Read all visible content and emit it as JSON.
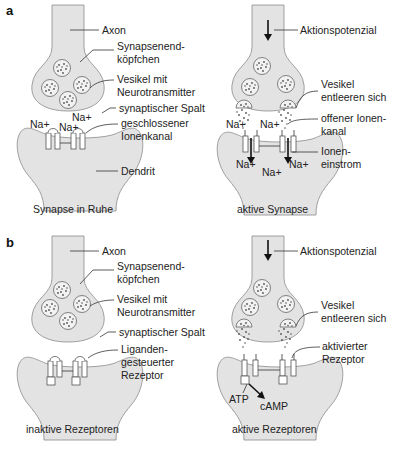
{
  "panels": [
    {
      "id": "a",
      "label": "a",
      "left": {
        "caption": "Synapse in Ruhe",
        "labels": {
          "axon": "Axon",
          "terminal_1": "Synapsenend-",
          "terminal_2": "köpfchen",
          "vesicle_1": "Vesikel mit",
          "vesicle_2": "Neurotransmitter",
          "cleft": "synaptischer Spalt",
          "channel_1": "geschlossener",
          "channel_2": "Ionenkanal",
          "dendrite": "Dendrit"
        },
        "ions": [
          "Na+",
          "Na+",
          "Na+"
        ]
      },
      "right": {
        "caption": "aktive Synapse",
        "labels": {
          "ap": "Aktionspotenzial",
          "vesicle_1": "Vesikel",
          "vesicle_2": "entleeren sich",
          "channel_1": "offener Ionen-",
          "channel_2": "kanal",
          "influx_1": "Ionen-",
          "influx_2": "einstrom"
        },
        "ions": [
          "Na+",
          "Na+",
          "Na+",
          "Na+",
          "Na+"
        ]
      }
    },
    {
      "id": "b",
      "label": "b",
      "left": {
        "caption": "inaktive Rezeptoren",
        "labels": {
          "axon": "Axon",
          "terminal_1": "Synapsenend-",
          "terminal_2": "köpfchen",
          "vesicle_1": "Vesikel mit",
          "vesicle_2": "Neurotransmitter",
          "cleft": "synaptischer Spalt",
          "receptor_1": "Liganden-",
          "receptor_2": "gesteuerter",
          "receptor_3": "Rezeptor"
        }
      },
      "right": {
        "caption": "aktive Rezeptoren",
        "labels": {
          "ap": "Aktionspotenzial",
          "vesicle_1": "Vesikel",
          "vesicle_2": "entleeren sich",
          "receptor_1": "aktivierter",
          "receptor_2": "Rezeptor",
          "atp": "ATP",
          "camp": "cAMP"
        }
      }
    }
  ],
  "colors": {
    "tissue_fill": "#e3e3e3",
    "tissue_stroke": "#8a8a8a",
    "text": "#222222"
  }
}
